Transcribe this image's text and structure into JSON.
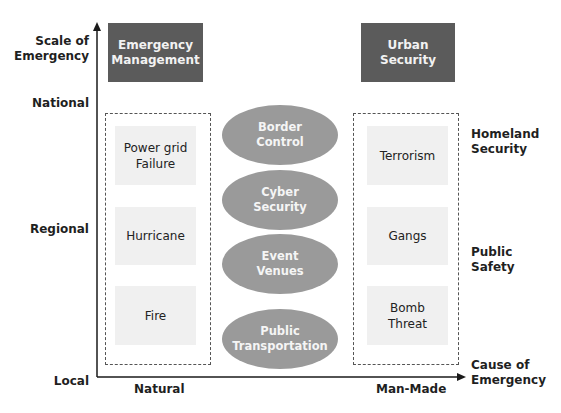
{
  "y_axis": {
    "title": "Scale of\nEmergency",
    "ticks": [
      "National",
      "Regional",
      "Local"
    ]
  },
  "x_axis": {
    "title": "Cause of\nEmergency",
    "ticks": [
      "Natural",
      "Man-Made"
    ]
  },
  "header_boxes": {
    "left": "Emergency\nManagement",
    "right": "Urban\nSecurity"
  },
  "right_labels": {
    "top": "Homeland\nSecurity",
    "middle": "Public\nSafety"
  },
  "natural_items": [
    "Power grid\nFailure",
    "Hurricane",
    "Fire"
  ],
  "manmade_items": [
    "Terrorism",
    "Gangs",
    "Bomb\nThreat"
  ],
  "center_ellipses": [
    "Border\nControl",
    "Cyber\nSecurity",
    "Event\nVenues",
    "Public\nTransportation"
  ],
  "colors": {
    "header_fill": "#5b5b5b",
    "ellipse_fill": "#9a9a9a",
    "item_fill": "#f0f0f0",
    "axis": "#1a1a1a"
  }
}
